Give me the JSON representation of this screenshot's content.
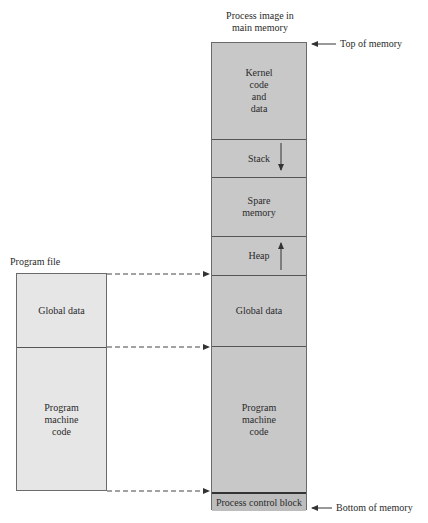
{
  "process_image": {
    "title": "Process image in\nmain memory",
    "segments": [
      {
        "label": "Kernel\ncode\nand\ndata"
      },
      {
        "label": "Stack",
        "arrow": "down"
      },
      {
        "label": "Spare\nmemory"
      },
      {
        "label": "Heap",
        "arrow": "up"
      },
      {
        "label": "Global data"
      },
      {
        "label": "Program\nmachine\ncode"
      },
      {
        "label": "Process control block"
      }
    ],
    "top_label": "Top of memory",
    "bottom_label": "Bottom of memory"
  },
  "program_file": {
    "title": "Program file",
    "segments": [
      {
        "label": "Global data"
      },
      {
        "label": "Program\nmachine\ncode"
      }
    ]
  },
  "colors": {
    "memory_fill": "#c8c8c8",
    "file_fill": "#e6e6e6",
    "line": "#555555"
  }
}
